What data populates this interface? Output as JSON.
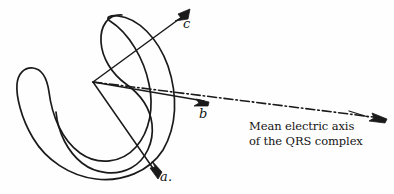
{
  "figure": {
    "kind": "hand-drawn-vectorcardiogram-diagram",
    "background_color": "#fefefe",
    "ink_color": "#1a1a1a",
    "width": 394,
    "height": 194,
    "vector_origin": {
      "x": 93,
      "y": 82
    },
    "vectors": [
      {
        "label": "a.",
        "name": "vector-a",
        "tip": {
          "x": 158,
          "y": 177
        },
        "direction": "down-right"
      },
      {
        "label": "b",
        "name": "vector-b",
        "tip": {
          "x": 208,
          "y": 102
        },
        "direction": "right-slightly-down"
      },
      {
        "label": "c",
        "name": "vector-c",
        "tip": {
          "x": 189,
          "y": 10
        },
        "direction": "up-right"
      }
    ],
    "mean_axis": {
      "name": "mean-electric-axis",
      "line_style": "dash-dot",
      "start": {
        "x": 93,
        "y": 82
      },
      "end": {
        "x": 386,
        "y": 119
      },
      "caption_line_1": "Mean electric axis",
      "caption_line_2": "of the QRS complex"
    },
    "loops": [
      {
        "name": "outer-loop",
        "description": "large open horseshoe curve"
      },
      {
        "name": "inner-loop",
        "description": "smaller nested horseshoe curve with upper lobe"
      }
    ]
  }
}
